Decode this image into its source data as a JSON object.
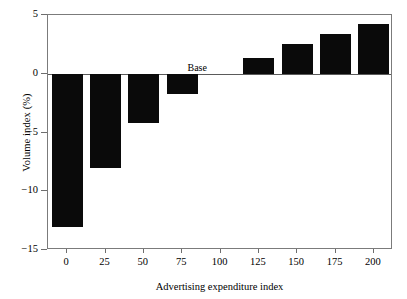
{
  "chart_data": {
    "type": "bar",
    "title": "",
    "xlabel": "Advertising expenditure index",
    "ylabel": "Volume index (%)",
    "categories": [
      "0",
      "25",
      "50",
      "75",
      "100",
      "125",
      "150",
      "175",
      "200"
    ],
    "values": [
      -13.0,
      -8.0,
      -4.2,
      -1.7,
      0,
      1.3,
      2.5,
      3.4,
      4.2
    ],
    "xlim": [
      -12.5,
      212.5
    ],
    "ylim": [
      -15,
      5
    ],
    "yticks": [
      5,
      0,
      -5,
      -10,
      -15
    ],
    "ytick_labels": [
      "5",
      "0",
      "−5",
      "−10",
      "−15"
    ],
    "xticks": [
      0,
      25,
      50,
      75,
      100,
      125,
      150,
      175,
      200
    ],
    "xtick_labels": [
      "0",
      "25",
      "50",
      "75",
      "100",
      "125",
      "150",
      "175",
      "200"
    ],
    "grid": false,
    "legend": false,
    "bar_color": "#0a0a0a",
    "frame_color": "#7b7b7b",
    "zero_line_color": "#5a5a5a",
    "annotations": [
      {
        "text": "Base",
        "x": 100,
        "y": 0.45
      }
    ]
  }
}
